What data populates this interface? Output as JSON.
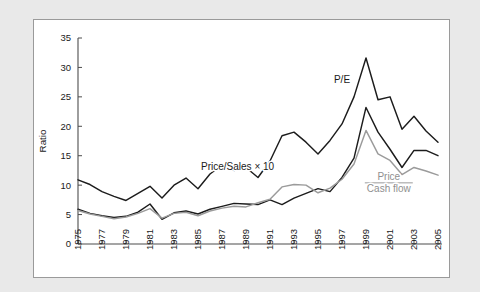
{
  "figure": {
    "background_color": "#e9e9e9",
    "card_background": "#ffffff",
    "card_border_color": "#9a9a9a"
  },
  "chart_data": {
    "type": "line",
    "title": "",
    "xlabel": "",
    "ylabel": "Ratio",
    "xlim": [
      1975,
      2005
    ],
    "ylim": [
      0,
      35
    ],
    "grid": false,
    "legend_position": "inline-annotations",
    "y_ticks": [
      0,
      5,
      10,
      15,
      20,
      25,
      30,
      35
    ],
    "x_ticks": [
      1975,
      1977,
      1979,
      1981,
      1983,
      1985,
      1987,
      1989,
      1991,
      1993,
      1995,
      1997,
      1999,
      2001,
      2003,
      2005
    ],
    "x": [
      1975,
      1976,
      1977,
      1978,
      1979,
      1980,
      1981,
      1982,
      1983,
      1984,
      1985,
      1986,
      1987,
      1988,
      1989,
      1990,
      1991,
      1992,
      1993,
      1994,
      1995,
      1996,
      1997,
      1998,
      1999,
      2000,
      2001,
      2002,
      2003,
      2004,
      2005
    ],
    "series": [
      {
        "name": "P/E",
        "color": "#1c1c1c",
        "label": "P/E",
        "values": [
          10.9,
          10.1,
          8.9,
          8.1,
          7.4,
          8.6,
          9.8,
          7.8,
          10.0,
          11.2,
          9.4,
          11.9,
          13.4,
          12.5,
          13.0,
          11.3,
          14.1,
          18.4,
          19.0,
          17.3,
          15.3,
          17.6,
          20.4,
          25.0,
          31.6,
          24.5,
          25.0,
          19.5,
          21.7,
          19.2,
          17.3
        ]
      },
      {
        "name": "Price/Sales x 10",
        "color": "#1c1c1c",
        "label": "Price/Sales × 10",
        "values": [
          5.9,
          5.2,
          4.8,
          4.5,
          4.7,
          5.4,
          6.8,
          4.2,
          5.3,
          5.6,
          5.1,
          5.9,
          6.4,
          6.9,
          6.8,
          6.7,
          7.5,
          6.7,
          7.8,
          8.6,
          9.4,
          8.9,
          11.3,
          14.6,
          23.2,
          19.0,
          16.1,
          13.0,
          15.9,
          15.9,
          15.0
        ]
      },
      {
        "name": "Price / Cash flow",
        "color": "#9b9b9b",
        "label_numerator": "Price",
        "label_denominator": "Cash flow",
        "values": [
          5.7,
          5.1,
          4.7,
          4.3,
          4.6,
          5.2,
          6.0,
          4.4,
          5.2,
          5.4,
          4.8,
          5.6,
          6.1,
          6.4,
          6.3,
          7.0,
          7.6,
          9.7,
          10.1,
          10.0,
          8.7,
          9.5,
          11.0,
          13.6,
          19.3,
          15.3,
          14.2,
          11.8,
          13.0,
          12.4,
          11.7
        ]
      }
    ],
    "annotations": [
      {
        "text": "P/E",
        "x": 1997.0,
        "y": 27.3
      },
      {
        "text": "Price/Sales × 10",
        "x": 1988.3,
        "y": 12.5
      },
      {
        "text": "Price",
        "x": 2000.9,
        "y": 10.9
      },
      {
        "text": "Cash flow",
        "x": 2000.9,
        "y": 8.8
      }
    ]
  }
}
